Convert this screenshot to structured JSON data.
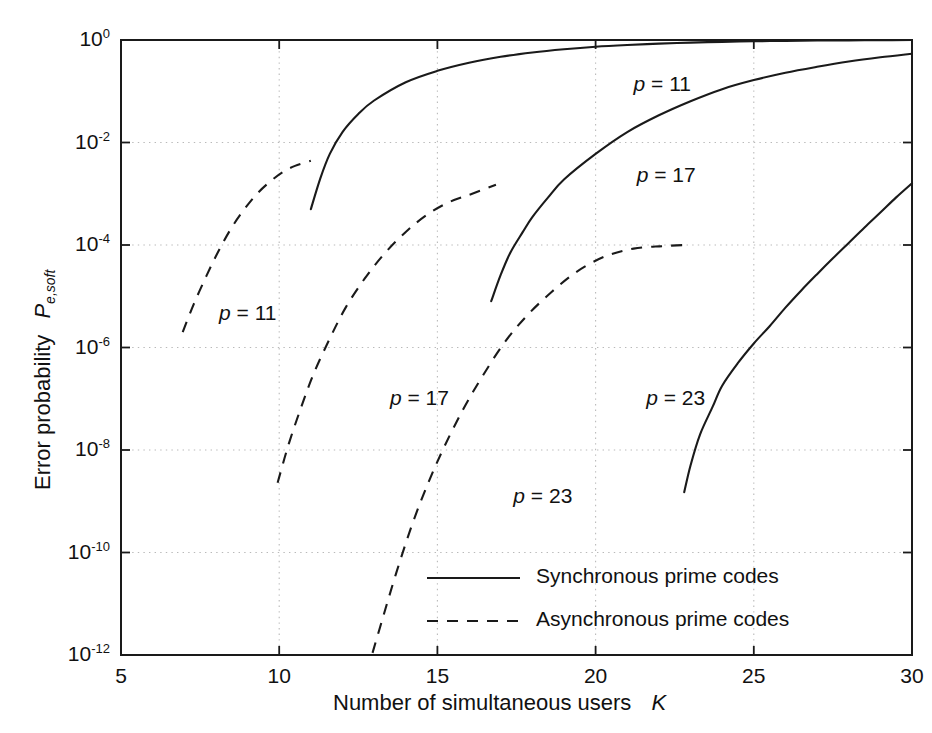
{
  "chart_data": {
    "type": "line",
    "title": "",
    "xlabel": "Number of simultaneous users   K",
    "xlabel_text": "Number of simultaneous users",
    "xlabel_symbol": "K",
    "ylabel_text": "Error probability",
    "ylabel_symbol": "P",
    "ylabel_subscript": "e,soft",
    "xscale": "linear",
    "yscale": "log",
    "xlim": [
      5,
      30
    ],
    "ylim": [
      1e-12,
      1
    ],
    "xticks": [
      5,
      10,
      15,
      20,
      25,
      30
    ],
    "xtick_labels": [
      "5",
      "10",
      "15",
      "20",
      "25",
      "30"
    ],
    "yticks": [
      1,
      0.01,
      0.0001,
      1e-06,
      1e-08,
      1e-10,
      1e-12
    ],
    "ytick_labels": [
      "10^0",
      "10^-2",
      "10^-4",
      "10^-6",
      "10^-8",
      "10^-10",
      "10^-12"
    ],
    "ytick_mantissas": [
      "10",
      "10",
      "10",
      "10",
      "10",
      "10",
      "10"
    ],
    "ytick_exponents": [
      "0",
      "-2",
      "-4",
      "-6",
      "-8",
      "-10",
      "-12"
    ],
    "grid": true,
    "legend_position": "lower right",
    "legend": [
      {
        "label": "Synchronous prime codes",
        "style": "solid"
      },
      {
        "label": "Asynchronous prime codes",
        "style": "dashed"
      }
    ],
    "series": [
      {
        "name": "Synchronous prime codes, p = 11",
        "style": "solid",
        "label": "p = 11",
        "label_symbol": "p",
        "label_value": "= 11",
        "label_x": 21.2,
        "label_y": 0.13,
        "points": [
          [
            11.0,
            0.0005
          ],
          [
            11.3,
            0.002
          ],
          [
            11.6,
            0.006
          ],
          [
            12.0,
            0.016
          ],
          [
            12.5,
            0.036
          ],
          [
            13.0,
            0.066
          ],
          [
            14.0,
            0.15
          ],
          [
            15.0,
            0.25
          ],
          [
            16.0,
            0.36
          ],
          [
            17.0,
            0.47
          ],
          [
            18.0,
            0.57
          ],
          [
            19.0,
            0.66
          ],
          [
            20.0,
            0.74
          ],
          [
            21.0,
            0.8
          ],
          [
            22.0,
            0.85
          ],
          [
            23.0,
            0.89
          ],
          [
            24.0,
            0.92
          ],
          [
            25.0,
            0.945
          ],
          [
            26.0,
            0.962
          ],
          [
            27.0,
            0.975
          ],
          [
            28.0,
            0.985
          ],
          [
            29.0,
            0.993
          ],
          [
            30.0,
            0.998
          ]
        ]
      },
      {
        "name": "Synchronous prime codes, p = 17",
        "style": "solid",
        "label": "p = 17",
        "label_symbol": "p",
        "label_value": "= 17",
        "label_x": 21.3,
        "label_y": 0.0022,
        "points": [
          [
            16.7,
            8e-06
          ],
          [
            17.0,
            2.6e-05
          ],
          [
            17.3,
            7e-05
          ],
          [
            17.7,
            0.00018
          ],
          [
            18.0,
            0.00035
          ],
          [
            18.5,
            0.00085
          ],
          [
            19.0,
            0.0019
          ],
          [
            20.0,
            0.006
          ],
          [
            21.0,
            0.016
          ],
          [
            22.0,
            0.034
          ],
          [
            23.0,
            0.064
          ],
          [
            24.0,
            0.11
          ],
          [
            25.0,
            0.165
          ],
          [
            26.0,
            0.23
          ],
          [
            27.0,
            0.3
          ],
          [
            28.0,
            0.38
          ],
          [
            29.0,
            0.46
          ],
          [
            30.0,
            0.54
          ]
        ]
      },
      {
        "name": "Synchronous prime codes, p = 23",
        "style": "solid",
        "label": "p = 23",
        "label_symbol": "p",
        "label_value": "= 23",
        "label_x": 21.6,
        "label_y": 1e-07,
        "points": [
          [
            22.8,
            1.5e-09
          ],
          [
            23.0,
            5e-09
          ],
          [
            23.3,
            2e-08
          ],
          [
            23.7,
            7e-08
          ],
          [
            24.0,
            1.8e-07
          ],
          [
            24.5,
            5e-07
          ],
          [
            25.0,
            1.2e-06
          ],
          [
            25.5,
            2.6e-06
          ],
          [
            26.0,
            6e-06
          ],
          [
            26.5,
            1.3e-05
          ],
          [
            27.0,
            2.7e-05
          ],
          [
            27.5,
            5.5e-05
          ],
          [
            28.0,
            0.00011
          ],
          [
            28.5,
            0.00022
          ],
          [
            29.0,
            0.00043
          ],
          [
            29.5,
            0.00085
          ],
          [
            30.0,
            0.0016
          ]
        ]
      },
      {
        "name": "Asynchronous prime codes, p = 11",
        "style": "dashed",
        "label": "p = 11",
        "label_symbol": "p",
        "label_value": "= 11",
        "label_x": 8.1,
        "label_y": 4.5e-06,
        "points": [
          [
            6.95,
            2e-06
          ],
          [
            7.3,
            7e-06
          ],
          [
            7.7,
            2.5e-05
          ],
          [
            8.1,
            8e-05
          ],
          [
            8.5,
            0.00022
          ],
          [
            8.9,
            0.0005
          ],
          [
            9.3,
            0.001
          ],
          [
            9.7,
            0.0017
          ],
          [
            10.1,
            0.0026
          ],
          [
            10.5,
            0.0035
          ],
          [
            11.0,
            0.0044
          ]
        ]
      },
      {
        "name": "Asynchronous prime codes, p = 17",
        "style": "dashed",
        "label": "p = 17",
        "label_symbol": "p",
        "label_value": "= 17",
        "label_x": 13.5,
        "label_y": 1e-07,
        "points": [
          [
            9.95,
            2.3e-09
          ],
          [
            10.3,
            1.3e-08
          ],
          [
            10.7,
            7e-08
          ],
          [
            11.1,
            3.2e-07
          ],
          [
            11.6,
            1.5e-06
          ],
          [
            12.1,
            6e-06
          ],
          [
            12.7,
            2.2e-05
          ],
          [
            13.3,
            6.5e-05
          ],
          [
            14.0,
            0.00018
          ],
          [
            14.7,
            0.0004
          ],
          [
            15.4,
            0.0007
          ],
          [
            16.1,
            0.001
          ],
          [
            16.85,
            0.0015
          ]
        ]
      },
      {
        "name": "Asynchronous prime codes, p = 23",
        "style": "dashed",
        "label": "p = 23",
        "label_symbol": "p",
        "label_value": "= 23",
        "label_x": 17.4,
        "label_y": 1.2e-09,
        "points": [
          [
            12.95,
            1.1e-12
          ],
          [
            13.3,
            6e-12
          ],
          [
            13.7,
            4e-11
          ],
          [
            14.2,
            3.5e-10
          ],
          [
            14.7,
            2.2e-09
          ],
          [
            15.2,
            1.1e-08
          ],
          [
            15.8,
            6e-08
          ],
          [
            16.4,
            2.6e-07
          ],
          [
            17.1,
            1.2e-06
          ],
          [
            17.8,
            4e-06
          ],
          [
            18.6,
            1.2e-05
          ],
          [
            19.4,
            3e-05
          ],
          [
            20.3,
            6e-05
          ],
          [
            21.2,
            8.5e-05
          ],
          [
            22.1,
            9.5e-05
          ],
          [
            22.85,
            0.0001
          ]
        ]
      }
    ]
  }
}
